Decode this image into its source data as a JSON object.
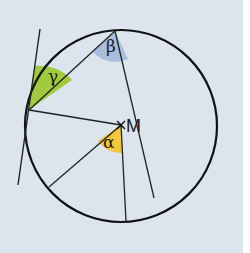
{
  "diagram": {
    "type": "geometry",
    "colors": {
      "background": "#dce5ed",
      "stroke": "#111111",
      "gamma_fill": "#9fcb3d",
      "beta_fill": "#a9bedd",
      "alpha_fill": "#f3c63b"
    },
    "labels": {
      "center": "M",
      "alpha": "α",
      "beta": "β",
      "gamma": "γ"
    }
  }
}
